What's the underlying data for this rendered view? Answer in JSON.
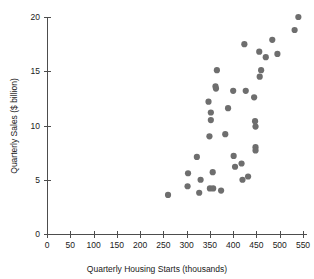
{
  "chart_data": {
    "type": "scatter",
    "title": "",
    "xlabel": "Quarterly Housing Starts (thousands)",
    "ylabel": "Quarterly Sales ($ billion)",
    "xlim": [
      0,
      550
    ],
    "ylim": [
      0,
      20
    ],
    "xticks": [
      0,
      50,
      100,
      150,
      200,
      250,
      300,
      350,
      400,
      450,
      500,
      550
    ],
    "xtick_labels": [
      "0",
      "50",
      "100",
      "150",
      "200",
      "250",
      "300",
      "350",
      "400",
      "450",
      "500",
      "550"
    ],
    "yticks": [
      0,
      5,
      10,
      15,
      20
    ],
    "ytick_labels": [
      "0",
      "5",
      "10",
      "15",
      "20"
    ],
    "grid": false,
    "legend": false,
    "marker_color": "#6e6e6e",
    "marker_size": 3.1,
    "points": [
      {
        "x": 260,
        "y": 3.6
      },
      {
        "x": 303,
        "y": 5.6
      },
      {
        "x": 302,
        "y": 4.4
      },
      {
        "x": 322,
        "y": 7.1
      },
      {
        "x": 330,
        "y": 5.0
      },
      {
        "x": 327,
        "y": 3.8
      },
      {
        "x": 347,
        "y": 12.2
      },
      {
        "x": 352,
        "y": 11.2
      },
      {
        "x": 352,
        "y": 10.5
      },
      {
        "x": 349,
        "y": 9.0
      },
      {
        "x": 356,
        "y": 5.7
      },
      {
        "x": 350,
        "y": 4.2
      },
      {
        "x": 357,
        "y": 4.2
      },
      {
        "x": 362,
        "y": 13.6
      },
      {
        "x": 363,
        "y": 13.4
      },
      {
        "x": 365,
        "y": 15.1
      },
      {
        "x": 374,
        "y": 4.0
      },
      {
        "x": 383,
        "y": 9.2
      },
      {
        "x": 389,
        "y": 11.6
      },
      {
        "x": 400,
        "y": 13.2
      },
      {
        "x": 401,
        "y": 7.2
      },
      {
        "x": 404,
        "y": 6.2
      },
      {
        "x": 418,
        "y": 6.5
      },
      {
        "x": 420,
        "y": 5.0
      },
      {
        "x": 424,
        "y": 17.5
      },
      {
        "x": 427,
        "y": 13.2
      },
      {
        "x": 432,
        "y": 5.3
      },
      {
        "x": 445,
        "y": 12.6
      },
      {
        "x": 447,
        "y": 10.4
      },
      {
        "x": 448,
        "y": 9.9
      },
      {
        "x": 448,
        "y": 8.0
      },
      {
        "x": 448,
        "y": 7.7
      },
      {
        "x": 456,
        "y": 16.8
      },
      {
        "x": 457,
        "y": 14.5
      },
      {
        "x": 460,
        "y": 15.1
      },
      {
        "x": 470,
        "y": 16.3
      },
      {
        "x": 484,
        "y": 17.9
      },
      {
        "x": 495,
        "y": 16.6
      },
      {
        "x": 532,
        "y": 18.8
      },
      {
        "x": 540,
        "y": 20.0
      }
    ]
  }
}
